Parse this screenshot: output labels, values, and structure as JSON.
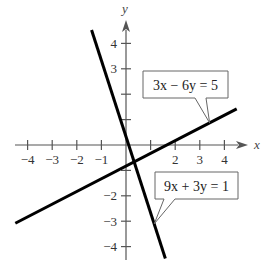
{
  "chart_data": {
    "type": "line",
    "title": "",
    "xlabel": "x",
    "ylabel": "y",
    "xlim": [
      -4.5,
      4.8
    ],
    "ylim": [
      -4.5,
      4.8
    ],
    "grid": false,
    "x_ticks": [
      -4,
      -3,
      -2,
      -1,
      1,
      2,
      3,
      4
    ],
    "y_ticks": [
      -4,
      -3,
      -2,
      -1,
      1,
      2,
      3,
      4
    ],
    "x_tick_labels": [
      "−4",
      "−3",
      "−2",
      "−1",
      "",
      "2",
      "3",
      "4"
    ],
    "y_tick_labels": [
      "−4",
      "−3",
      "−2",
      "",
      "",
      "",
      "3",
      "4"
    ],
    "series": [
      {
        "name": "3x − 6y = 5",
        "equation": "3x - 6y = 5",
        "x": [
          -4.5,
          4.5
        ],
        "y": [
          -3.08,
          1.42
        ]
      },
      {
        "name": "9x + 3y = 1",
        "equation": "9x + 3y = 1",
        "x": [
          -1.4,
          1.6
        ],
        "y": [
          4.53,
          -4.47
        ]
      }
    ],
    "annotations": [
      {
        "text": "3x − 6y = 5",
        "points_to": [
          3.4,
          0.87
        ]
      },
      {
        "text": "9x + 3y = 1",
        "points_to": [
          1.15,
          -3.1
        ]
      }
    ]
  }
}
